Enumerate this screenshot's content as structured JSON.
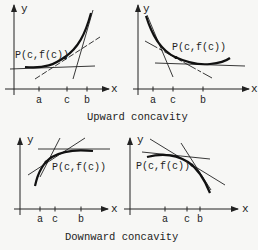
{
  "figure": {
    "top_caption": "Upward concavity",
    "bottom_caption": "Downward concavity",
    "panels": [
      {
        "id": "upward-increasing",
        "axis_x_label": "x",
        "axis_y_label": "y",
        "point_label": "P(c,f(c))",
        "ticks": [
          "a",
          "c",
          "b"
        ]
      },
      {
        "id": "upward-decreasing",
        "axis_x_label": "x",
        "axis_y_label": "y",
        "point_label": "P(c,f(c))",
        "ticks": [
          "a",
          "c",
          "b"
        ]
      },
      {
        "id": "downward-increasing",
        "axis_x_label": "x",
        "axis_y_label": "y",
        "point_label": "P(c,f(c))",
        "ticks": [
          "a",
          "c",
          "b"
        ]
      },
      {
        "id": "downward-decreasing",
        "axis_x_label": "x",
        "axis_y_label": "y",
        "point_label": "P(c,f(c))",
        "ticks": [
          "a",
          "c",
          "b"
        ]
      }
    ]
  },
  "colors": {
    "ink": "#222222",
    "background": "#f7f7f5"
  }
}
